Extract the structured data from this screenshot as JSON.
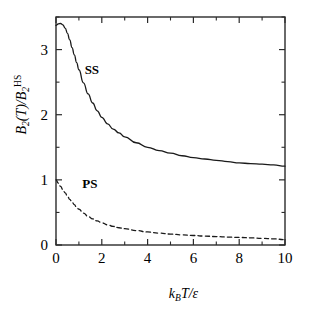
{
  "chart_data": {
    "type": "line",
    "title": "",
    "xlabel": "k_B T/ε",
    "ylabel": "B_2(T)/B_2^HS",
    "xlim": [
      0,
      10
    ],
    "ylim": [
      0,
      3.5
    ],
    "grid": false,
    "legend_position": "inline-annotation",
    "xticks": [
      0,
      2,
      4,
      6,
      8,
      10
    ],
    "xtick_labels": [
      "0",
      "2",
      "4",
      "6",
      "8",
      "10"
    ],
    "xminor_ticks": [
      1,
      3,
      5,
      7,
      9
    ],
    "yticks": [
      0,
      1,
      2,
      3
    ],
    "ytick_labels": [
      "0",
      "1",
      "2",
      "3"
    ],
    "yminor_ticks": [
      0.5,
      1.5,
      2.5,
      3.5
    ],
    "series": [
      {
        "name": "SS",
        "style": "solid",
        "color": "#1a1a1a",
        "annotation": "SS",
        "annotation_xy": [
          1.25,
          2.62
        ],
        "x": [
          0.0,
          0.1,
          0.2,
          0.3,
          0.4,
          0.5,
          0.6,
          0.7,
          0.8,
          0.9,
          1.0,
          1.2,
          1.4,
          1.6,
          1.8,
          2.0,
          2.25,
          2.5,
          2.75,
          3.0,
          3.5,
          4.0,
          4.5,
          5.0,
          5.5,
          6.0,
          6.5,
          7.0,
          7.5,
          8.0,
          8.5,
          9.0,
          9.5,
          10.0
        ],
        "values": [
          3.37,
          3.395,
          3.4,
          3.38,
          3.33,
          3.25,
          3.15,
          3.03,
          2.92,
          2.8,
          2.69,
          2.49,
          2.32,
          2.18,
          2.06,
          1.96,
          1.86,
          1.78,
          1.72,
          1.66,
          1.57,
          1.5,
          1.45,
          1.41,
          1.37,
          1.34,
          1.32,
          1.3,
          1.28,
          1.26,
          1.25,
          1.24,
          1.23,
          1.21
        ]
      },
      {
        "name": "PS",
        "style": "dashed",
        "color": "#1a1a1a",
        "annotation": "PS",
        "annotation_xy": [
          1.15,
          0.87
        ],
        "x": [
          0.0,
          0.1,
          0.2,
          0.3,
          0.4,
          0.5,
          0.6,
          0.7,
          0.8,
          0.9,
          1.0,
          1.2,
          1.4,
          1.6,
          1.8,
          2.0,
          2.25,
          2.5,
          2.75,
          3.0,
          3.5,
          4.0,
          4.5,
          5.0,
          5.5,
          6.0,
          6.5,
          7.0,
          7.5,
          8.0,
          8.5,
          9.0,
          9.5,
          10.0
        ],
        "values": [
          1.0,
          0.95,
          0.9,
          0.85,
          0.8,
          0.75,
          0.7,
          0.66,
          0.62,
          0.58,
          0.55,
          0.49,
          0.44,
          0.4,
          0.37,
          0.34,
          0.31,
          0.285,
          0.265,
          0.25,
          0.222,
          0.2,
          0.183,
          0.168,
          0.156,
          0.146,
          0.137,
          0.129,
          0.122,
          0.116,
          0.11,
          0.102,
          0.094,
          0.083
        ]
      }
    ]
  },
  "axis_labels": {
    "y_B": "B",
    "y_sub2": "2",
    "y_paren_T": "(T)/",
    "y_B2": "B",
    "y_sub2b": "2",
    "y_sup_hs": "HS",
    "x_k": "k",
    "x_subB": "B",
    "x_T": "T/",
    "x_eps": "ε"
  },
  "style": {
    "frame_color": "#2b2b2b",
    "background": "#ffffff",
    "tick_color": "#2b2b2b"
  }
}
